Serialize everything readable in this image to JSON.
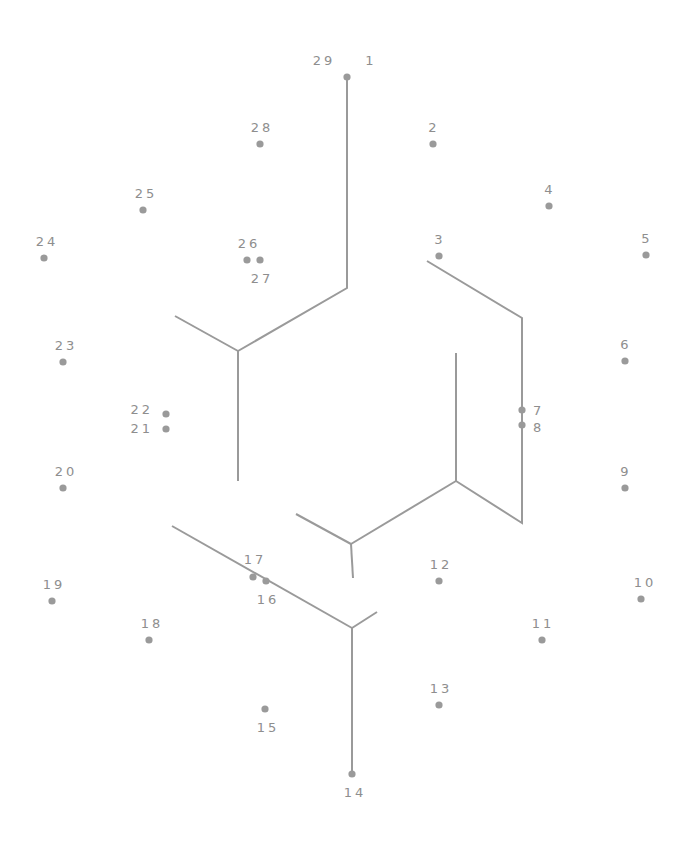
{
  "puzzle": {
    "type": "connect-the-dots",
    "colors": {
      "line": "#9a9a9a",
      "dot": "#9a9a9a",
      "label": "#8e8e8e",
      "background": "#ffffff"
    },
    "dots": [
      {
        "n": "1",
        "x": 347,
        "y": 77,
        "lx": 371,
        "ly": 65,
        "anchor": "middle"
      },
      {
        "n": "2",
        "x": 433,
        "y": 144,
        "lx": 434,
        "ly": 132,
        "anchor": "middle"
      },
      {
        "n": "3",
        "x": 439,
        "y": 256,
        "lx": 440,
        "ly": 244,
        "anchor": "middle"
      },
      {
        "n": "4",
        "x": 549,
        "y": 206,
        "lx": 550,
        "ly": 194,
        "anchor": "middle"
      },
      {
        "n": "5",
        "x": 646,
        "y": 255,
        "lx": 647,
        "ly": 243,
        "anchor": "middle"
      },
      {
        "n": "6",
        "x": 625,
        "y": 361,
        "lx": 626,
        "ly": 349,
        "anchor": "middle"
      },
      {
        "n": "7",
        "x": 522,
        "y": 410,
        "lx": 533,
        "ly": 415,
        "anchor": "start"
      },
      {
        "n": "8",
        "x": 522,
        "y": 425,
        "lx": 533,
        "ly": 432,
        "anchor": "start"
      },
      {
        "n": "9",
        "x": 625,
        "y": 488,
        "lx": 626,
        "ly": 476,
        "anchor": "middle"
      },
      {
        "n": "10",
        "x": 641,
        "y": 599,
        "lx": 645,
        "ly": 587,
        "anchor": "middle"
      },
      {
        "n": "11",
        "x": 542,
        "y": 640,
        "lx": 543,
        "ly": 628,
        "anchor": "middle"
      },
      {
        "n": "12",
        "x": 439,
        "y": 581,
        "lx": 441,
        "ly": 569,
        "anchor": "middle"
      },
      {
        "n": "13",
        "x": 439,
        "y": 705,
        "lx": 441,
        "ly": 693,
        "anchor": "middle"
      },
      {
        "n": "14",
        "x": 352,
        "y": 774,
        "lx": 355,
        "ly": 797,
        "anchor": "middle"
      },
      {
        "n": "15",
        "x": 265,
        "y": 709,
        "lx": 268,
        "ly": 732,
        "anchor": "middle"
      },
      {
        "n": "16",
        "x": 266,
        "y": 581,
        "lx": 268,
        "ly": 604,
        "anchor": "middle"
      },
      {
        "n": "17",
        "x": 253,
        "y": 577,
        "lx": 255,
        "ly": 564,
        "anchor": "middle"
      },
      {
        "n": "18",
        "x": 149,
        "y": 640,
        "lx": 152,
        "ly": 628,
        "anchor": "middle"
      },
      {
        "n": "19",
        "x": 52,
        "y": 601,
        "lx": 54,
        "ly": 589,
        "anchor": "middle"
      },
      {
        "n": "20",
        "x": 63,
        "y": 488,
        "lx": 66,
        "ly": 476,
        "anchor": "middle"
      },
      {
        "n": "21",
        "x": 166,
        "y": 429,
        "lx": 153,
        "ly": 433,
        "anchor": "end"
      },
      {
        "n": "22",
        "x": 166,
        "y": 414,
        "lx": 153,
        "ly": 414,
        "anchor": "end"
      },
      {
        "n": "23",
        "x": 63,
        "y": 362,
        "lx": 66,
        "ly": 350,
        "anchor": "middle"
      },
      {
        "n": "24",
        "x": 44,
        "y": 258,
        "lx": 47,
        "ly": 246,
        "anchor": "middle"
      },
      {
        "n": "25",
        "x": 143,
        "y": 210,
        "lx": 146,
        "ly": 198,
        "anchor": "middle"
      },
      {
        "n": "26",
        "x": 247,
        "y": 260,
        "lx": 249,
        "ly": 248,
        "anchor": "middle"
      },
      {
        "n": "27",
        "x": 260,
        "y": 260,
        "lx": 262,
        "ly": 283,
        "anchor": "middle"
      },
      {
        "n": "28",
        "x": 260,
        "y": 144,
        "lx": 262,
        "ly": 132,
        "anchor": "middle"
      },
      {
        "n": "29",
        "x": 347,
        "y": 77,
        "lx": 324,
        "ly": 65,
        "anchor": "middle",
        "shares_dot_with": "1"
      }
    ],
    "guide_lines": [
      {
        "id": "left-block-top",
        "points": "347,77 347,288 238,351"
      },
      {
        "id": "left-block-arm",
        "points": "175,316 238,351"
      },
      {
        "id": "left-block-stem",
        "points": "238,351 238,481"
      },
      {
        "id": "right-block-outer",
        "points": "427,261 522,318 522,523 456,481"
      },
      {
        "id": "right-block-stem",
        "points": "456,353 456,481"
      },
      {
        "id": "right-block-arm",
        "points": "456,481 351,544"
      },
      {
        "id": "mid-block-arm",
        "points": "296,514 351,544"
      },
      {
        "id": "mid-block-stem",
        "points": "351,544 353,578"
      },
      {
        "id": "bottom-block-diag",
        "points": "172,526 352,628"
      },
      {
        "id": "bottom-block-arm",
        "points": "352,628 377,612"
      },
      {
        "id": "bottom-block-stem",
        "points": "352,628 352,774"
      }
    ]
  }
}
